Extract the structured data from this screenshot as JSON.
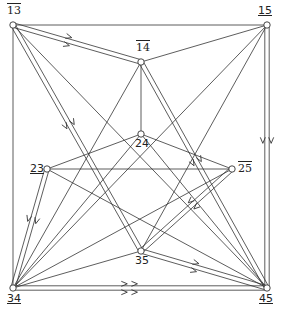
{
  "diagram": {
    "type": "directed-graph",
    "nodes": [
      {
        "id": "13",
        "label": "13",
        "mark": "overline",
        "x": 13,
        "y": 25
      },
      {
        "id": "15",
        "label": "15",
        "mark": "underline",
        "x": 267,
        "y": 25
      },
      {
        "id": "14",
        "label": "14",
        "mark": "overline",
        "x": 141,
        "y": 62
      },
      {
        "id": "24",
        "label": "24",
        "mark": "none",
        "x": 141,
        "y": 134
      },
      {
        "id": "23",
        "label": "23",
        "mark": "underline",
        "x": 47,
        "y": 169
      },
      {
        "id": "25",
        "label": "25",
        "mark": "overline",
        "x": 232,
        "y": 169
      },
      {
        "id": "35",
        "label": "35",
        "mark": "none",
        "x": 141,
        "y": 251
      },
      {
        "id": "34",
        "label": "34",
        "mark": "underline",
        "x": 13,
        "y": 288
      },
      {
        "id": "45",
        "label": "45",
        "mark": "underline",
        "x": 267,
        "y": 288
      }
    ],
    "double_edges": [
      {
        "from": "13",
        "to": "14",
        "arrows": 1
      },
      {
        "from": "13",
        "to": "35",
        "arrows": 1
      },
      {
        "from": "14",
        "to": "45",
        "arrows": 1
      },
      {
        "from": "15",
        "to": "45",
        "arrows": 1
      },
      {
        "from": "23",
        "to": "34",
        "arrows": 1
      },
      {
        "from": "25",
        "to": "35",
        "arrows": 1
      },
      {
        "from": "35",
        "to": "45",
        "arrows": 1
      },
      {
        "from": "34",
        "to": "45",
        "arrows": 2
      }
    ],
    "single_edges": [
      {
        "from": "13",
        "to": "15"
      },
      {
        "from": "13",
        "to": "34"
      },
      {
        "from": "13",
        "to": "45"
      },
      {
        "from": "14",
        "to": "15"
      },
      {
        "from": "14",
        "to": "24"
      },
      {
        "from": "14",
        "to": "34"
      },
      {
        "from": "24",
        "to": "23"
      },
      {
        "from": "24",
        "to": "25"
      },
      {
        "from": "24",
        "to": "34"
      },
      {
        "from": "24",
        "to": "45"
      },
      {
        "from": "23",
        "to": "25"
      },
      {
        "from": "23",
        "to": "45"
      },
      {
        "from": "25",
        "to": "34"
      },
      {
        "from": "15",
        "to": "35"
      },
      {
        "from": "15",
        "to": "34"
      },
      {
        "from": "34",
        "to": "35"
      }
    ]
  }
}
